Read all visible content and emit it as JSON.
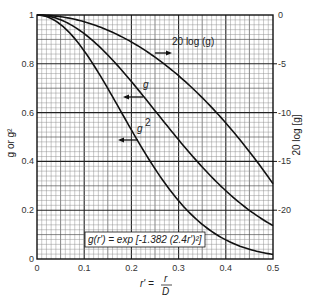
{
  "chart_data": {
    "type": "line",
    "title": "",
    "xlabel": "r' = r/D",
    "ylabel": "g or g^2",
    "y2label": "20 log [g]",
    "xlim": [
      0,
      0.5
    ],
    "ylim": [
      0,
      1
    ],
    "y2lim": [
      0,
      -25
    ],
    "grid": true,
    "x_ticks": [
      "0",
      "0.1",
      "0.2",
      "0.3",
      "0.4",
      "0.5"
    ],
    "y_ticks": [
      "0",
      "0.2",
      "0.4",
      "0.6",
      "0.8",
      "1"
    ],
    "y2_ticks": [
      "0",
      "-5",
      "-10",
      "-15",
      "-20"
    ],
    "formula": "g(r') = exp [-1.382 (2.4r')²]",
    "x": [
      0,
      0.05,
      0.1,
      0.15,
      0.2,
      0.25,
      0.3,
      0.35,
      0.4,
      0.45,
      0.5
    ],
    "series": [
      {
        "name": "20 log (g)",
        "axis": "right",
        "arrow": "right",
        "values": [
          0,
          -0.69,
          -2.77,
          -6.23,
          -11.08,
          -17.31,
          -24.93,
          -33.93,
          -44.32,
          -56.09,
          -69.25
        ],
        "display_values_db": [
          0,
          -0.17,
          -0.69,
          -1.56,
          -2.77,
          -4.33,
          -6.23,
          -8.48,
          -11.08,
          -14.02,
          -17.31
        ]
      },
      {
        "name": "g",
        "axis": "left",
        "arrow": "left",
        "values": [
          1,
          0.98,
          0.924,
          0.836,
          0.727,
          0.607,
          0.488,
          0.377,
          0.279,
          0.199,
          0.137
        ]
      },
      {
        "name": "g²",
        "axis": "left",
        "arrow": "left",
        "values": [
          1,
          0.961,
          0.853,
          0.699,
          0.528,
          0.369,
          0.238,
          0.142,
          0.078,
          0.04,
          0.019
        ]
      }
    ]
  },
  "labels": {
    "series_20log": "20 log (g)",
    "series_g": "g",
    "series_g2": "g",
    "series_g2_sup": "2",
    "ylabel_left": "g or g²",
    "ylabel_right": "20 log [g]",
    "xlabel_lhs": "r' =",
    "xlabel_num": "r",
    "xlabel_den": "D",
    "formula": "g(r') = exp [-1.382 (2.4r')²]"
  }
}
